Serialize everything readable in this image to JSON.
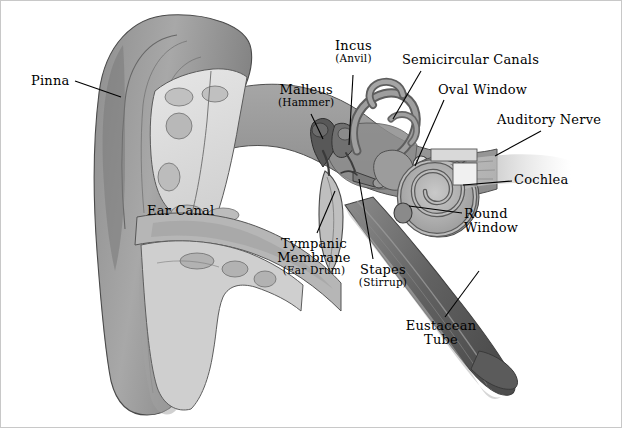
{
  "figure": {
    "style": "grayscale anatomical illustration",
    "background_color": "#ffffff",
    "line_color": "#000000",
    "border_color": "#c8c8c8"
  },
  "palette": {
    "dark_gray": "#6e6e6e",
    "mid_gray": "#9a9a9a",
    "light_gray": "#c4c4c4",
    "pale_gray": "#e2e2e2",
    "cartilage": "#d0d0d0",
    "shadow": "#4a4a4a",
    "outline": "#3a3a3a"
  },
  "labels": [
    {
      "id": "pinna",
      "main": "Pinna",
      "sub": "",
      "x": 30,
      "y": 73,
      "align": "left"
    },
    {
      "id": "malleus",
      "main": "Malleus",
      "sub": "(Hammer)",
      "x": 277,
      "y": 95,
      "align": "center"
    },
    {
      "id": "incus",
      "main": "Incus",
      "sub": "(Anvil)",
      "x": 336,
      "y": 50,
      "align": "center"
    },
    {
      "id": "semicircular-canals",
      "main": "Semicircular Canals",
      "sub": "",
      "x": 401,
      "y": 57,
      "align": "left"
    },
    {
      "id": "oval-window",
      "main": "Oval Window",
      "sub": "",
      "x": 437,
      "y": 85,
      "align": "left"
    },
    {
      "id": "auditory-nerve",
      "main": "Auditory Nerve",
      "sub": "",
      "x": 496,
      "y": 115,
      "align": "left"
    },
    {
      "id": "cochlea",
      "main": "Cochlea",
      "sub": "",
      "x": 513,
      "y": 174,
      "align": "left"
    },
    {
      "id": "ear-canal",
      "main": "Ear Canal",
      "sub": "",
      "x": 146,
      "y": 205,
      "align": "left"
    },
    {
      "id": "tympanic-membrane",
      "main": "Tympanic Membrane",
      "sub": "(Ear Drum)",
      "x": 268,
      "y": 236,
      "align": "center"
    },
    {
      "id": "stapes",
      "main": "Stapes",
      "sub": "(Stirrup)",
      "x": 352,
      "y": 262,
      "align": "center"
    },
    {
      "id": "round-window",
      "main": "Round Window",
      "sub": "",
      "x": 463,
      "y": 207,
      "align": "left"
    },
    {
      "id": "eustacean-tube",
      "main": "Eustacean Tube",
      "sub": "",
      "x": 397,
      "y": 321,
      "align": "center"
    }
  ],
  "structures": [
    "pinna",
    "ear-canal",
    "tympanic-membrane",
    "malleus",
    "incus",
    "stapes",
    "semicircular-canals",
    "oval-window",
    "round-window",
    "cochlea",
    "auditory-nerve",
    "eustacean-tube"
  ]
}
